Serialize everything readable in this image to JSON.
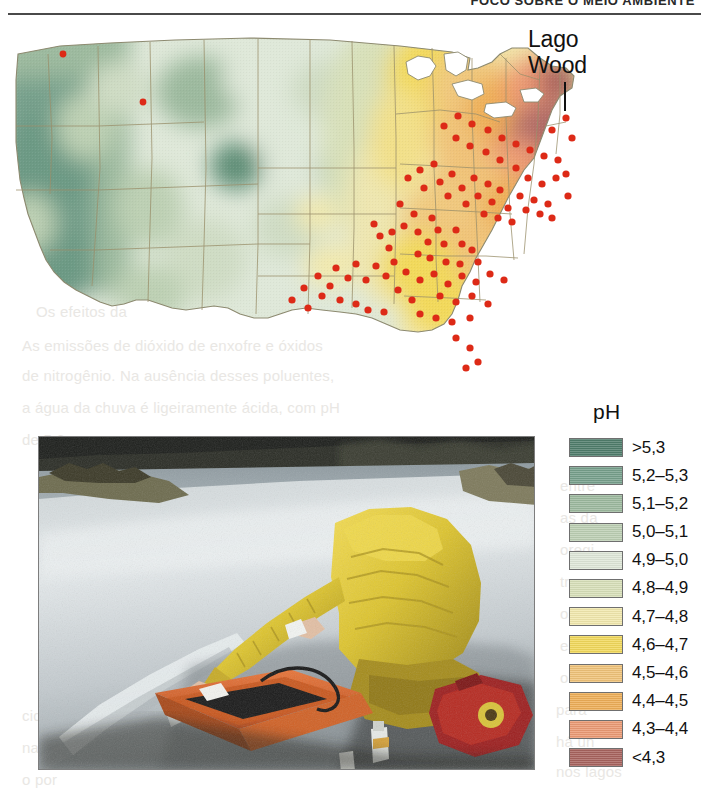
{
  "running_head": {
    "text": "FOCO SOBRE O MEIO AMBIENTE"
  },
  "map": {
    "title": "Mapa de pH da precipitação nos Estados Unidos",
    "callout": {
      "line1": "Lago",
      "line2": "Wood"
    },
    "site_marker_color": "#dd2a17",
    "site_marker_label": "estação de monitoramento",
    "state_border_color": "#9a8f6a",
    "country_border_color": "#8d8a70",
    "coastline_color": "#8d8a70",
    "background_color": "#ffffff"
  },
  "legend": {
    "title": "pH",
    "entries": [
      {
        "label": ">5,3",
        "color": "#4f7d6b"
      },
      {
        "label": "5,2–5,3",
        "color": "#77a08c"
      },
      {
        "label": "5,1–5,2",
        "color": "#9dba9f"
      },
      {
        "label": "5,0–5,1",
        "color": "#bdd0b4"
      },
      {
        "label": "4,9–5,0",
        "color": "#dfe8d9"
      },
      {
        "label": "4,8–4,9",
        "color": "#d8e0b9"
      },
      {
        "label": "4,7–4,8",
        "color": "#f2e9ae"
      },
      {
        "label": "4,6–4,7",
        "color": "#f2d95b"
      },
      {
        "label": "4,5–4,6",
        "color": "#f0c379"
      },
      {
        "label": "4,4–4,5",
        "color": "#eeae57"
      },
      {
        "label": "4,3–4,4",
        "color": "#ec9a74"
      },
      {
        "label": "<4,3",
        "color": "#a8635e"
      }
    ]
  },
  "photo": {
    "caption": "Pesquisador coletando amostra de água em lago congelado",
    "subject": "field-researcher-sampling-water",
    "elements": [
      "yellow-rain-jacket",
      "orange-instrument-case",
      "sample-bottle",
      "red-backpack",
      "ice-sheet",
      "open-water"
    ]
  },
  "showthrough": {
    "lines": [
      {
        "x": 34,
        "y": 52,
        "text": "ambiente o acidez"
      },
      {
        "x": 20,
        "y": 150,
        "text": "Brasil"
      },
      {
        "x": 36,
        "y": 296,
        "text": "Os efeitos da"
      },
      {
        "x": 22,
        "y": 330,
        "text": "As emissões de dióxido de enxofre e óxidos"
      },
      {
        "x": 22,
        "y": 360,
        "text": "de nitrogênio. Na ausência desses poluentes,"
      },
      {
        "x": 22,
        "y": 392,
        "text": "a água da chuva é ligeiramente ácida, com pH"
      },
      {
        "x": 22,
        "y": 424,
        "text": "de 5,6."
      },
      {
        "x": 560,
        "y": 470,
        "text": "entre"
      },
      {
        "x": 560,
        "y": 502,
        "text": "as da"
      },
      {
        "x": 560,
        "y": 534,
        "text": "oregi"
      },
      {
        "x": 560,
        "y": 566,
        "text": "trar"
      },
      {
        "x": 560,
        "y": 598,
        "text": "os ra"
      },
      {
        "x": 560,
        "y": 630,
        "text": "esce"
      },
      {
        "x": 560,
        "y": 662,
        "text": "ondo"
      },
      {
        "x": 556,
        "y": 694,
        "text": "para"
      },
      {
        "x": 556,
        "y": 726,
        "text": "há un"
      },
      {
        "x": 556,
        "y": 756,
        "text": "nos lagos"
      },
      {
        "x": 22,
        "y": 700,
        "text": "cidos"
      },
      {
        "x": 22,
        "y": 732,
        "text": "nais"
      },
      {
        "x": 22,
        "y": 764,
        "text": "o por"
      }
    ]
  }
}
